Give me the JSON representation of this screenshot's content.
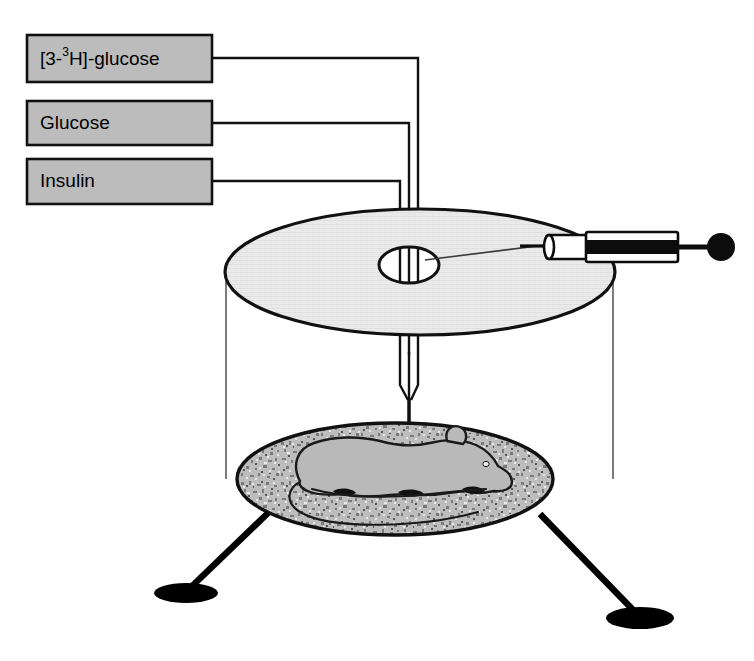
{
  "figure": {
    "background_color": "#ffffff",
    "width": 754,
    "height": 661
  },
  "reagent_labels": [
    {
      "id": "tracer",
      "prefix": "[3-",
      "superscript": "3",
      "suffix": "H]-glucose",
      "full_text": "[3-3H]-glucose",
      "box": {
        "x": 27,
        "y": 35,
        "w": 185,
        "h": 47
      }
    },
    {
      "id": "glucose",
      "prefix": "Glucose",
      "superscript": "",
      "suffix": "",
      "full_text": "Glucose",
      "box": {
        "x": 27,
        "y": 101,
        "w": 185,
        "h": 44
      }
    },
    {
      "id": "insulin",
      "prefix": "Insulin",
      "superscript": "",
      "suffix": "",
      "full_text": "Insulin",
      "box": {
        "x": 27,
        "y": 159,
        "w": 185,
        "h": 45
      }
    }
  ],
  "apparatus": {
    "top_platform_name": "top platform disc",
    "access_hole_name": "catheter access hole",
    "bedding_disc_name": "bedding tray",
    "animal_name": "mouse",
    "swivel_syringe_name": "infusion syringe",
    "leg_count": 3
  },
  "colors": {
    "box_fill": "#bcbcbc",
    "ink": "#111111",
    "platform_fill": "#e9e9e9",
    "animal_fill": "#b9b9b9",
    "bedding_base": "#b4b4b4",
    "cage_wall": "#5a5a5a"
  }
}
